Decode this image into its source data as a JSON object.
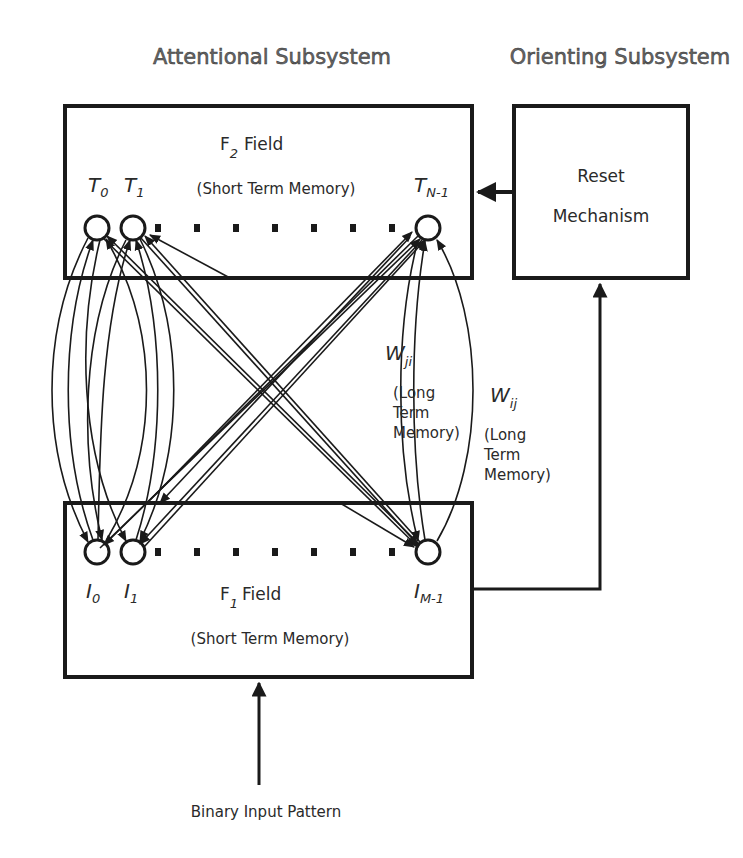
{
  "headers": {
    "attentional": "Attentional Subsystem",
    "orienting": "Orienting Subsystem"
  },
  "f2": {
    "title_main": "F",
    "title_sub": "2",
    "title_rest": "Field",
    "memory": "(Short Term Memory)",
    "nodes": [
      {
        "main": "T",
        "sub": "0"
      },
      {
        "main": "T",
        "sub": "1"
      },
      {
        "main": "T",
        "sub": "N-1"
      }
    ]
  },
  "f1": {
    "title_main": "F",
    "title_sub": "1",
    "title_rest": "Field",
    "memory": "(Short Term Memory)",
    "nodes": [
      {
        "main": "I",
        "sub": "0"
      },
      {
        "main": "I",
        "sub": "1"
      },
      {
        "main": "I",
        "sub": "M-1"
      }
    ]
  },
  "reset": {
    "line1": "Reset",
    "line2": "Mechanism"
  },
  "weights": {
    "ji": {
      "main": "W",
      "sub": "ji",
      "l1": "(Long",
      "l2": "Term",
      "l3": "Memory)"
    },
    "ij": {
      "main": "W",
      "sub": "ij",
      "l1": "(Long",
      "l2": "Term",
      "l3": "Memory)"
    }
  },
  "input": {
    "label": "Binary Input Pattern"
  },
  "colors": {
    "stroke": "#1a1a1a",
    "header_text": "#666666"
  }
}
